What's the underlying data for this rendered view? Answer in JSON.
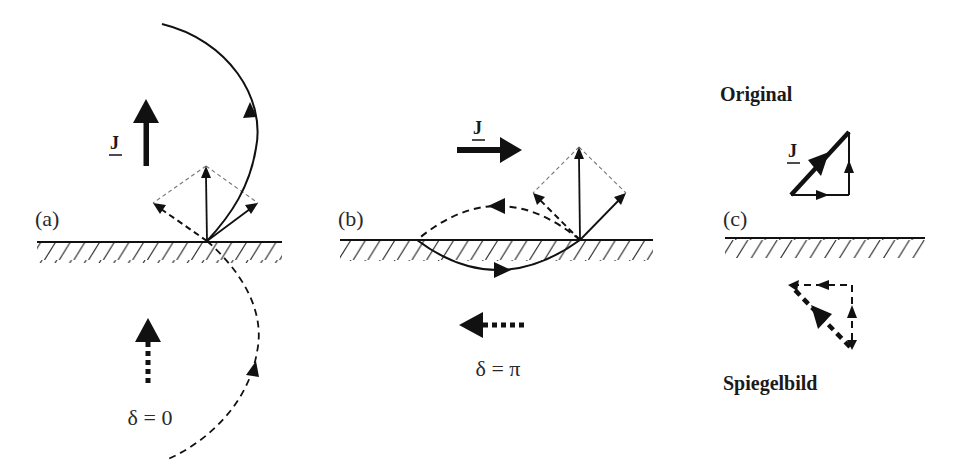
{
  "figure": {
    "panels": [
      {
        "id": "a",
        "label": "(a)",
        "current_label": "J",
        "condition": "δ = 0"
      },
      {
        "id": "b",
        "label": "(b)",
        "current_label": "J",
        "condition": "δ = π"
      },
      {
        "id": "c",
        "label": "(c)",
        "current_label": "J",
        "original_title": "Original",
        "mirror_title": "Spiegelbild"
      }
    ],
    "colors": {
      "ink": "#111111",
      "guide": "#777777",
      "background": "#ffffff"
    }
  }
}
